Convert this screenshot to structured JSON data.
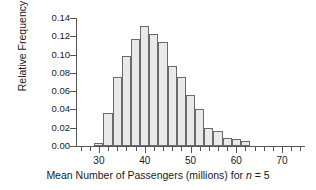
{
  "chart_data": {
    "type": "bar",
    "title": "",
    "subtitle": "",
    "xlabel_parts": {
      "before": "Mean Number of Passengers (millions) for ",
      "italic": "n",
      "after": " = 5"
    },
    "xlabel": "Mean Number of Passengers (millions) for n = 5",
    "ylabel": "Relative Frequency",
    "grid": false,
    "legend": "none",
    "bin_width": 2,
    "xlim": [
      25,
      75
    ],
    "ylim": [
      0.0,
      0.14
    ],
    "x_major_ticks": [
      30,
      40,
      50,
      60,
      70
    ],
    "x_minor_ticks": [
      26,
      28,
      32,
      34,
      36,
      38,
      42,
      44,
      46,
      48,
      52,
      54,
      56,
      58,
      62,
      64,
      66,
      68,
      72,
      74
    ],
    "x_tick_labels": [
      "30",
      "40",
      "50",
      "60",
      "70"
    ],
    "y_ticks": [
      0.0,
      0.02,
      0.04,
      0.06,
      0.08,
      0.1,
      0.12,
      0.14
    ],
    "y_tick_labels": [
      "0.00",
      "0.02",
      "0.04",
      "0.06",
      "0.08",
      "0.10",
      "0.12",
      "0.14"
    ],
    "bin_edges": [
      29,
      31,
      33,
      35,
      37,
      39,
      41,
      43,
      45,
      47,
      49,
      51,
      53,
      55,
      57,
      59,
      61,
      63
    ],
    "bin_centers": [
      30,
      32,
      34,
      36,
      38,
      40,
      42,
      44,
      46,
      48,
      50,
      52,
      54,
      56,
      58,
      60,
      62
    ],
    "values": [
      0.003,
      0.036,
      0.075,
      0.098,
      0.117,
      0.131,
      0.123,
      0.114,
      0.088,
      0.075,
      0.056,
      0.04,
      0.02,
      0.016,
      0.009,
      0.008,
      0.005
    ],
    "colors": {
      "bar_fill": "#e9e9e9",
      "bar_edge": "#6a6a6a",
      "axis": "#555555",
      "text": "#1a1a1a",
      "background": "#ffffff"
    }
  }
}
